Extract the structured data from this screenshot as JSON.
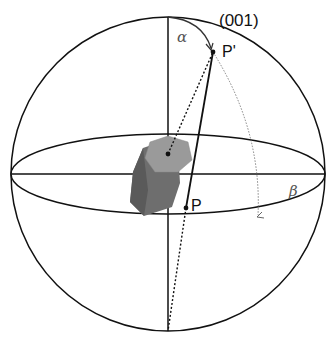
{
  "diagram": {
    "labels": {
      "face": "(001)",
      "pole_sphere": "P'",
      "pole_projection": "P",
      "alpha": "α",
      "beta": "β"
    },
    "colors": {
      "line": "#111111",
      "crystal_top": "#9a9a9a",
      "crystal_side": "#6e6e6e",
      "crystal_dark": "#555555",
      "beta_label": "#555555"
    }
  }
}
